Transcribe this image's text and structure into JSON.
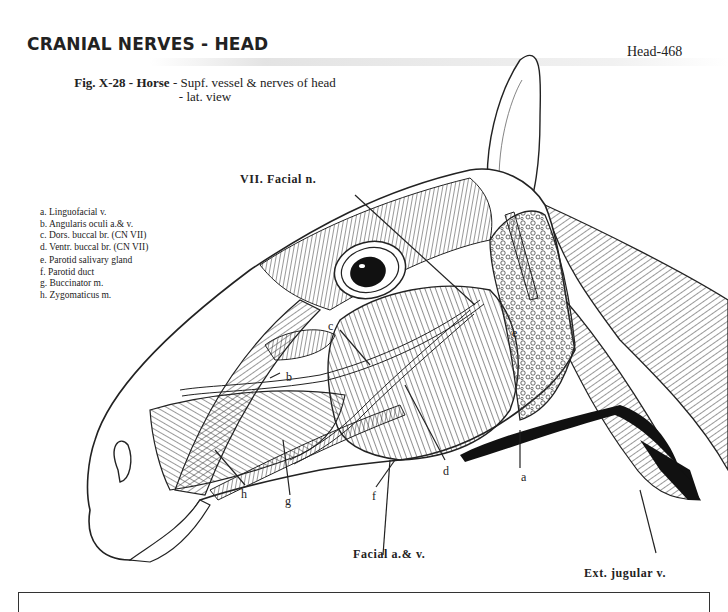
{
  "header": {
    "section_title": "CRANIAL NERVES - HEAD",
    "page_number": "Head-468"
  },
  "figure": {
    "caption": {
      "fig_id": "Fig. X-28",
      "sep1": " - ",
      "species": "Horse",
      "sep2": " - ",
      "description_line1": "Supf. vessel & nerves of head",
      "description_line2": "- lat. view"
    },
    "legend": [
      {
        "key": "a.",
        "label": "Linguofacial v."
      },
      {
        "key": "b.",
        "label": "Angularis oculi a.& v."
      },
      {
        "key": "c.",
        "label": "Dors. buccal br. (CN VII)"
      },
      {
        "key": "d.",
        "label": "Ventr. buccal br. (CN VII)"
      },
      {
        "key": "e.",
        "label": "Parotid salivary gland"
      },
      {
        "key": "f.",
        "label": "Parotid duct"
      },
      {
        "key": "g.",
        "label": "Buccinator m."
      },
      {
        "key": "h.",
        "label": "Zygomaticus m."
      }
    ],
    "callouts": {
      "facial_nerve": "VII. Facial n.",
      "facial_artery_vein": "Facial a.& v.",
      "ext_jugular": "Ext. jugular v."
    },
    "letters": {
      "a": "a",
      "b": "b",
      "c": "c",
      "d": "d",
      "e": "e",
      "f": "f",
      "g": "g",
      "h": "h"
    }
  }
}
